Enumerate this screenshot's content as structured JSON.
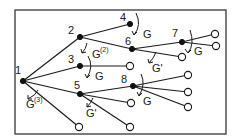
{
  "diagram": {
    "type": "tree",
    "frame": {
      "x": 15,
      "y": 10,
      "width": 211,
      "height": 124,
      "color": "#444444"
    },
    "colors": {
      "ink": "#1a1a1a",
      "background": "#ffffff"
    },
    "nodes": [
      {
        "id": "1",
        "label": "1",
        "kind": "filled",
        "x": 23,
        "y": 81
      },
      {
        "id": "2",
        "label": "2",
        "kind": "filled",
        "x": 80,
        "y": 37
      },
      {
        "id": "3",
        "label": "3",
        "kind": "filled",
        "x": 80,
        "y": 66
      },
      {
        "id": "4",
        "label": "4",
        "kind": "filled",
        "x": 130,
        "y": 24
      },
      {
        "id": "5",
        "label": "5",
        "kind": "filled",
        "x": 80,
        "y": 94
      },
      {
        "id": "6",
        "label": "6",
        "kind": "filled",
        "x": 132,
        "y": 49
      },
      {
        "id": "7",
        "label": "7",
        "kind": "filled",
        "x": 182,
        "y": 42
      },
      {
        "id": "8",
        "label": "8",
        "kind": "filled",
        "x": 133,
        "y": 86
      },
      {
        "id": "t1",
        "label": "",
        "kind": "open",
        "x": 215,
        "y": 34
      },
      {
        "id": "t2",
        "label": "",
        "kind": "open",
        "x": 216,
        "y": 46
      },
      {
        "id": "t3",
        "label": "",
        "kind": "open",
        "x": 182,
        "y": 57
      },
      {
        "id": "t4",
        "label": "",
        "kind": "open",
        "x": 130,
        "y": 66
      },
      {
        "id": "t5",
        "label": "",
        "kind": "open",
        "x": 188,
        "y": 75
      },
      {
        "id": "t6",
        "label": "",
        "kind": "open",
        "x": 188,
        "y": 92
      },
      {
        "id": "t7",
        "label": "",
        "kind": "open",
        "x": 188,
        "y": 107
      },
      {
        "id": "t8",
        "label": "",
        "kind": "open",
        "x": 131,
        "y": 103
      },
      {
        "id": "t9",
        "label": "",
        "kind": "open",
        "x": 130,
        "y": 127
      },
      {
        "id": "t10",
        "label": "",
        "kind": "open",
        "x": 79,
        "y": 127
      }
    ],
    "edges": [
      [
        "1",
        "2"
      ],
      [
        "1",
        "3"
      ],
      [
        "1",
        "5"
      ],
      [
        "1",
        "t10"
      ],
      [
        "2",
        "4"
      ],
      [
        "2",
        "6"
      ],
      [
        "3",
        "t4"
      ],
      [
        "5",
        "8"
      ],
      [
        "5",
        "t8"
      ],
      [
        "5",
        "t9"
      ],
      [
        "6",
        "7"
      ],
      [
        "6",
        "t3"
      ],
      [
        "7",
        "t1"
      ],
      [
        "7",
        "t2"
      ],
      [
        "8",
        "t5"
      ],
      [
        "8",
        "t6"
      ],
      [
        "8",
        "t7"
      ]
    ],
    "operators": [
      {
        "id": "g3",
        "text": "G",
        "sup": "(3)",
        "at_node": "1",
        "x": 26,
        "y": 108
      },
      {
        "id": "g2",
        "text": "G",
        "sup": "(2)",
        "at_node": "2",
        "x": 92,
        "y": 58
      },
      {
        "id": "g-3",
        "text": "G",
        "sup": "",
        "at_node": "3",
        "x": 95,
        "y": 80
      },
      {
        "id": "g-4",
        "text": "G",
        "sup": "",
        "at_node": "4",
        "x": 143,
        "y": 38
      },
      {
        "id": "gp-6",
        "text": "G'",
        "sup": "",
        "at_node": "6",
        "x": 152,
        "y": 72
      },
      {
        "id": "g-7",
        "text": "G",
        "sup": "",
        "at_node": "7",
        "x": 194,
        "y": 55
      },
      {
        "id": "gp-5",
        "text": "G'",
        "sup": "",
        "at_node": "5",
        "x": 86,
        "y": 117
      },
      {
        "id": "g-8",
        "text": "G",
        "sup": "",
        "at_node": "8",
        "x": 143,
        "y": 105
      }
    ]
  }
}
